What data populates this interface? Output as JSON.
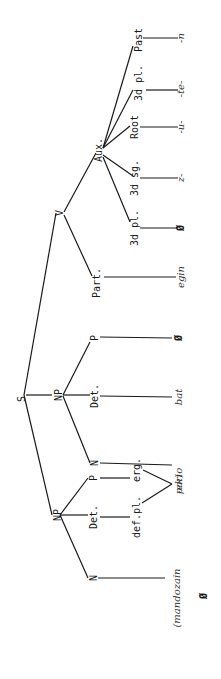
{
  "diagram": {
    "type": "syntax-tree",
    "orientation": "rotated-90-ccw",
    "nodes": {
      "S": "S",
      "np1": "NP",
      "np1_n": "N",
      "np1_det": "Det.",
      "np1_p": "P",
      "np1_defpl": "def.pl.",
      "np1_erg": "erg.",
      "np1_n_word": "(mandozain",
      "np1_suffix": "-ek)",
      "np1_zero": "Ø",
      "np2": "NP",
      "np2_n": "N",
      "np2_det": "Det.",
      "np2_p": "P",
      "np2_n_word": "pario",
      "np2_det_word": "bat",
      "np2_p_word": "Ø",
      "v": "V",
      "part": "Part.",
      "part_word": "egin",
      "aux": "Aux.",
      "aux_3dpl": "3d pl.",
      "aux_3dsg": "3d sg.",
      "aux_root": "Root",
      "aux_3dpl2": "3d pl.",
      "aux_past": "Past",
      "m_3dpl": "Ø",
      "m_3dsg": "z-",
      "m_root": "-u-",
      "m_3dpl2": "-te-",
      "m_past": "-n"
    }
  }
}
